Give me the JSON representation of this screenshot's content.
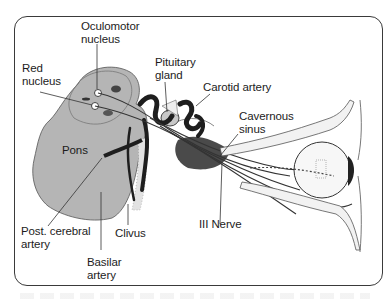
{
  "diagram": {
    "labels": {
      "oculomotor_nucleus": "Oculomotor\nnucleus",
      "red_nucleus": "Red\nnucleus",
      "pituitary_gland": "Pituitary\ngland",
      "carotid_artery": "Carotid artery",
      "cavernous_sinus": "Cavernous\nsinus",
      "pons": "Pons",
      "post_cerebral_artery": "Post. cerebral\nartery",
      "clivus": "Clivus",
      "basilar_artery": "Basilar\nartery",
      "iii_nerve": "III Nerve"
    },
    "colors": {
      "brainstem_fill": "#b5b5b5",
      "vessel": "#1e1e1e",
      "outline": "#3a3a3a",
      "background": "#ffffff"
    }
  }
}
